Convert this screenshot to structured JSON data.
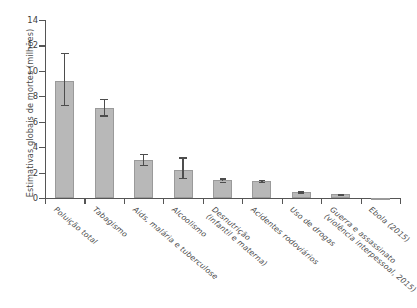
{
  "chart_data": {
    "type": "bar",
    "title": "",
    "xlabel": "",
    "ylabel": "Estimativas globais de mortes (milhões)",
    "ylim": [
      0,
      14
    ],
    "yticks": [
      0,
      2,
      4,
      6,
      8,
      10,
      12,
      14
    ],
    "grid": false,
    "legend": "none",
    "categories": [
      "Poluição total",
      "Tabagismo",
      "Aids, malária e tuberculose",
      "Alcoolismo",
      "Desnutrição (infantil e materna)",
      "Acidentes rodoviários",
      "Uso de drogas",
      "Guerra e assassinato (violência interpessoal, 2015)",
      "Ebola (2015)"
    ],
    "category_lines": [
      [
        "Poluição total"
      ],
      [
        "Tabagismo"
      ],
      [
        "Aids, malária e tuberculose"
      ],
      [
        "Alcoolismo"
      ],
      [
        "Desnutrição",
        "(infantil e materna)"
      ],
      [
        "Acidentes rodoviários"
      ],
      [
        "Uso de drogas"
      ],
      [
        "Guerra e assassinato",
        "(violência interpessoal, 2015)"
      ],
      [
        "Ebola (2015)"
      ]
    ],
    "values": [
      9.2,
      7.1,
      3.0,
      2.2,
      1.4,
      1.35,
      0.5,
      0.3,
      0.01
    ],
    "error_low": [
      7.3,
      6.5,
      2.6,
      1.6,
      1.3,
      1.25,
      0.45,
      0.28,
      0.0
    ],
    "error_high": [
      11.4,
      7.8,
      3.5,
      3.2,
      1.55,
      1.45,
      0.58,
      0.34,
      0.02
    ],
    "bar_color": "#b8b8b8",
    "bar_edge_color": "#9a9a9a",
    "error_color": "#4d4d4d",
    "axis_color": "#555555"
  }
}
